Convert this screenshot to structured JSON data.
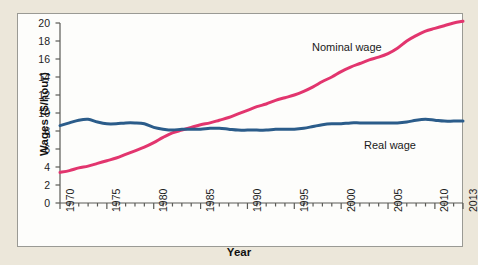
{
  "chart_data": {
    "type": "line",
    "title": "",
    "xlabel": "Year",
    "ylabel": "Wages ($/hour)",
    "xlim": [
      1970,
      2013
    ],
    "ylim": [
      0,
      20
    ],
    "grid": false,
    "legend_position": "inline-annotations",
    "y_ticks": [
      0,
      2,
      4,
      6,
      8,
      10,
      12,
      14,
      16,
      18,
      20
    ],
    "y_tick_labels": [
      "0",
      "2",
      "4",
      "6",
      "8",
      "10",
      "12",
      "14",
      "16",
      "18",
      "20"
    ],
    "x_ticks": [
      1970,
      1975,
      1980,
      1985,
      1990,
      1995,
      2000,
      2005,
      2010,
      2013
    ],
    "x_tick_labels": [
      "1970",
      "1975",
      "1980",
      "1985",
      "1990",
      "1995",
      "2000",
      "2005",
      "2010",
      "2013"
    ],
    "x_minor_tick_interval": 1,
    "x": [
      1970,
      1971,
      1972,
      1973,
      1974,
      1975,
      1976,
      1977,
      1978,
      1979,
      1980,
      1981,
      1982,
      1983,
      1984,
      1985,
      1986,
      1987,
      1988,
      1989,
      1990,
      1991,
      1992,
      1993,
      1994,
      1995,
      1996,
      1997,
      1998,
      1999,
      2000,
      2001,
      2002,
      2003,
      2004,
      2005,
      2006,
      2007,
      2008,
      2009,
      2010,
      2011,
      2012,
      2013
    ],
    "series": [
      {
        "name": "Nominal wage",
        "color": "#e2356e",
        "label_position": {
          "x": 1998,
          "y": 17.2
        },
        "values": [
          3.4,
          3.6,
          3.9,
          4.1,
          4.4,
          4.7,
          5.0,
          5.4,
          5.8,
          6.2,
          6.7,
          7.3,
          7.8,
          8.1,
          8.4,
          8.7,
          8.9,
          9.2,
          9.5,
          9.9,
          10.3,
          10.7,
          11.0,
          11.4,
          11.7,
          12.0,
          12.4,
          12.9,
          13.5,
          14.0,
          14.6,
          15.1,
          15.5,
          15.9,
          16.2,
          16.6,
          17.2,
          18.0,
          18.6,
          19.1,
          19.4,
          19.7,
          20.0,
          20.2
        ]
      },
      {
        "name": "Real wage",
        "color": "#2b5c8a",
        "label_position": {
          "x": 2004,
          "y": 7.5
        },
        "values": [
          8.6,
          8.9,
          9.2,
          9.3,
          9.0,
          8.8,
          8.8,
          8.9,
          8.9,
          8.8,
          8.4,
          8.2,
          8.1,
          8.2,
          8.2,
          8.2,
          8.3,
          8.3,
          8.2,
          8.1,
          8.1,
          8.1,
          8.1,
          8.2,
          8.2,
          8.2,
          8.3,
          8.5,
          8.7,
          8.8,
          8.8,
          8.9,
          8.9,
          8.9,
          8.9,
          8.9,
          8.9,
          9.0,
          9.2,
          9.3,
          9.2,
          9.1,
          9.1,
          9.1
        ]
      }
    ],
    "annotations": [
      {
        "text": "Nominal wage",
        "series": "Nominal wage"
      },
      {
        "text": "Real wage",
        "series": "Real wage"
      }
    ]
  },
  "axes": {
    "y_title": "Wages ($/hour)",
    "x_title": "Year"
  },
  "colors": {
    "nominal": "#e2356e",
    "real": "#2b5c8a",
    "page_background": "#ece7da",
    "plot_background": "#fdfdfb",
    "frame_border": "#9a9a94",
    "axis": "#5a5a56"
  }
}
